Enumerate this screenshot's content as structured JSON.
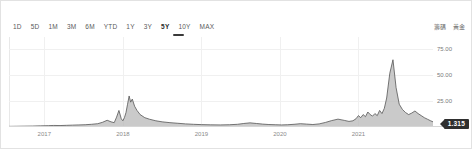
{
  "widget": {
    "title": "price-history-area-chart"
  },
  "range_selector": {
    "options": [
      "1D",
      "5D",
      "1M",
      "3M",
      "6M",
      "YTD",
      "1Y",
      "3Y",
      "5Y",
      "10Y",
      "MAX"
    ],
    "selected": "5Y"
  },
  "top_labels": [
    "籌碼",
    "黃金"
  ],
  "price_badge": {
    "value": "1.315"
  },
  "colors": {
    "line": "#555555",
    "fill": "#b8b8b8",
    "grid": "#f0f0f0",
    "axis": "#d6d6d6",
    "badge_bg": "#2f2f2f",
    "tick_text": "#8a8a8a"
  },
  "chart_data": {
    "type": "area",
    "title": "",
    "xlabel": "",
    "ylabel": "",
    "ylim": [
      0,
      87
    ],
    "xlim": [
      2016.55,
      2021.95
    ],
    "grid": true,
    "legend": "none",
    "yticks": [
      25.0,
      50.0,
      75.0
    ],
    "ytick_labels": [
      "25.00",
      "50.00",
      "75.00"
    ],
    "xticks": [
      2017,
      2018,
      2019,
      2020,
      2021
    ],
    "xtick_labels": [
      "2017",
      "2018",
      "2019",
      "2020",
      "2021"
    ],
    "current_value": 1.315,
    "series": [
      {
        "name": "price",
        "x": [
          2016.55,
          2016.65,
          2016.75,
          2016.85,
          2016.95,
          2017.05,
          2017.12,
          2017.2,
          2017.28,
          2017.36,
          2017.44,
          2017.52,
          2017.6,
          2017.68,
          2017.74,
          2017.8,
          2017.85,
          2017.89,
          2017.92,
          2017.95,
          2017.98,
          2018.0,
          2018.02,
          2018.04,
          2018.06,
          2018.08,
          2018.1,
          2018.12,
          2018.15,
          2018.18,
          2018.22,
          2018.28,
          2018.34,
          2018.42,
          2018.5,
          2018.6,
          2018.7,
          2018.8,
          2018.9,
          2019.0,
          2019.12,
          2019.24,
          2019.36,
          2019.46,
          2019.54,
          2019.62,
          2019.7,
          2019.78,
          2019.86,
          2019.94,
          2020.02,
          2020.1,
          2020.18,
          2020.26,
          2020.34,
          2020.42,
          2020.5,
          2020.58,
          2020.66,
          2020.74,
          2020.82,
          2020.88,
          2020.93,
          2020.97,
          2021.0,
          2021.03,
          2021.06,
          2021.09,
          2021.12,
          2021.15,
          2021.18,
          2021.21,
          2021.24,
          2021.27,
          2021.3,
          2021.33,
          2021.36,
          2021.4,
          2021.44,
          2021.48,
          2021.52,
          2021.56,
          2021.6,
          2021.64,
          2021.68,
          2021.72,
          2021.76,
          2021.8,
          2021.84,
          2021.88,
          2021.92,
          2021.95
        ],
        "y": [
          0.6,
          0.7,
          0.8,
          0.9,
          1.1,
          1.3,
          1.5,
          1.4,
          1.6,
          1.8,
          2.0,
          2.2,
          2.6,
          3.2,
          4.5,
          6.5,
          5.0,
          4.2,
          9.5,
          16.0,
          8.0,
          6.0,
          9.0,
          14.0,
          22.0,
          30.0,
          24.0,
          27.0,
          20.0,
          16.0,
          12.0,
          9.0,
          7.5,
          6.0,
          5.0,
          4.2,
          3.6,
          3.0,
          2.6,
          2.3,
          2.1,
          2.0,
          2.2,
          2.6,
          3.4,
          4.0,
          3.4,
          2.8,
          2.4,
          2.2,
          2.0,
          2.2,
          2.6,
          3.2,
          2.8,
          2.4,
          3.0,
          4.4,
          6.2,
          7.6,
          6.4,
          5.4,
          6.0,
          8.0,
          11.0,
          9.0,
          12.0,
          10.0,
          14.5,
          12.0,
          10.5,
          13.0,
          11.0,
          16.0,
          13.0,
          18.0,
          28.0,
          52.0,
          65.0,
          38.0,
          22.0,
          17.0,
          14.0,
          12.0,
          13.5,
          15.5,
          13.0,
          11.0,
          9.0,
          7.5,
          6.0,
          5.0
        ]
      }
    ]
  }
}
